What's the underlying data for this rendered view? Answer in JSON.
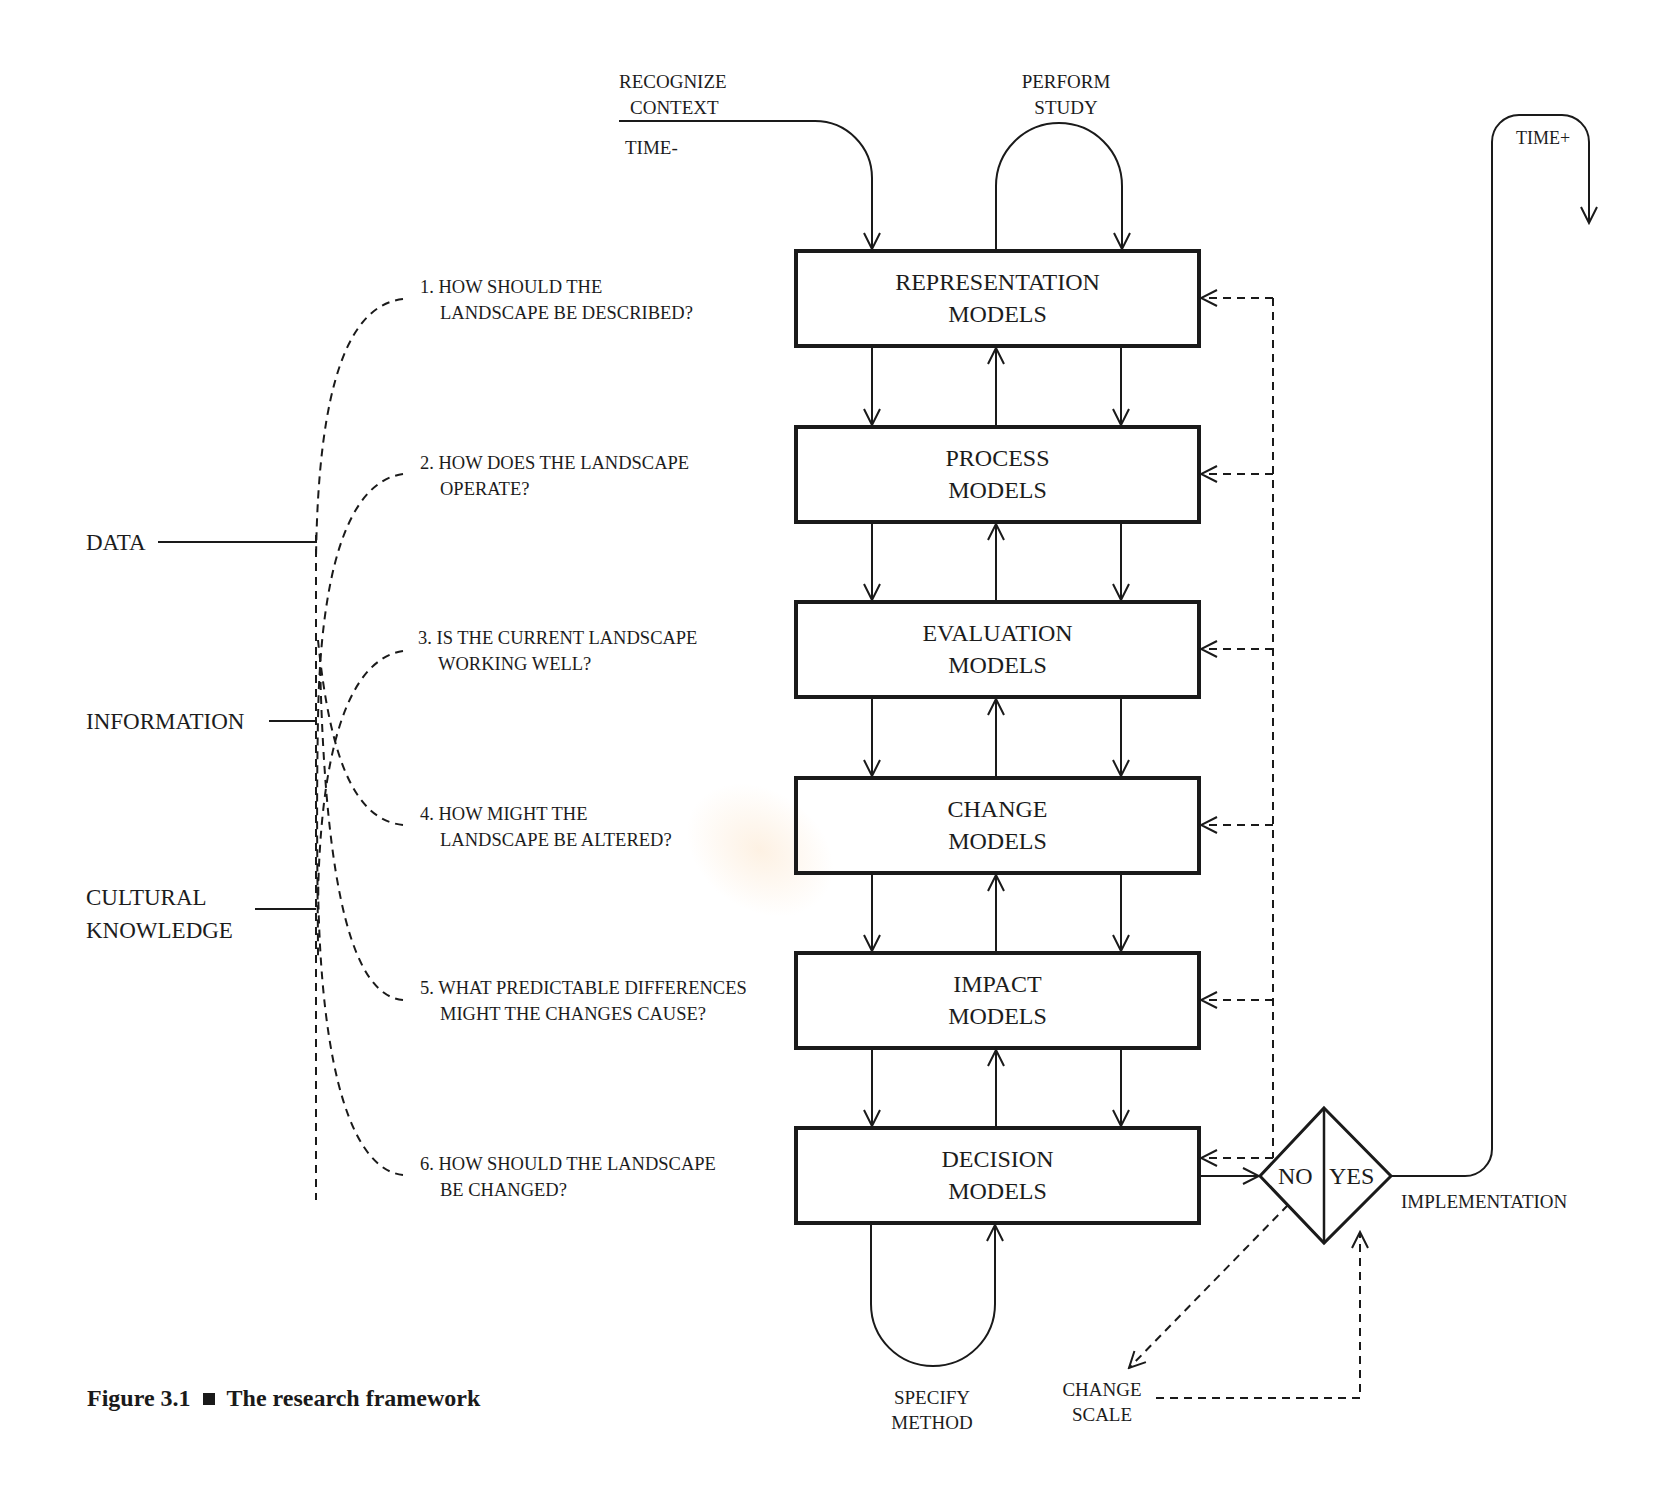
{
  "figure": {
    "caption_number": "Figure 3.1",
    "caption_separator": "■",
    "caption_title": "The research framework"
  },
  "top_labels": {
    "recognize_line1": "RECOGNIZE",
    "recognize_line2": "CONTEXT",
    "time_minus": "TIME-",
    "perform_line1": "PERFORM",
    "perform_line2": "STUDY",
    "time_plus": "TIME+"
  },
  "models": [
    {
      "line1": "REPRESENTATION",
      "line2": "MODELS"
    },
    {
      "line1": "PROCESS",
      "line2": "MODELS"
    },
    {
      "line1": "EVALUATION",
      "line2": "MODELS"
    },
    {
      "line1": "CHANGE",
      "line2": "MODELS"
    },
    {
      "line1": "IMPACT",
      "line2": "MODELS"
    },
    {
      "line1": "DECISION",
      "line2": "MODELS"
    }
  ],
  "questions": [
    {
      "line1": "1. HOW SHOULD THE",
      "line2": "LANDSCAPE BE DESCRIBED?"
    },
    {
      "line1": "2. HOW DOES THE LANDSCAPE",
      "line2": "OPERATE?"
    },
    {
      "line1": "3. IS THE CURRENT LANDSCAPE",
      "line2": "WORKING WELL?"
    },
    {
      "line1": "4. HOW MIGHT THE",
      "line2": "LANDSCAPE BE ALTERED?"
    },
    {
      "line1": "5. WHAT PREDICTABLE DIFFERENCES",
      "line2": "MIGHT THE CHANGES CAUSE?"
    },
    {
      "line1": "6. HOW SHOULD THE LANDSCAPE",
      "line2": "BE CHANGED?"
    }
  ],
  "knowledge_levels": {
    "data": "DATA",
    "information": "INFORMATION",
    "cultural_line1": "CULTURAL",
    "cultural_line2": "KNOWLEDGE"
  },
  "decision": {
    "no": "NO",
    "yes": "YES",
    "implementation": "IMPLEMENTATION"
  },
  "bottom_labels": {
    "specify_line1": "SPECIFY",
    "specify_line2": "METHOD",
    "change_scale_line1": "CHANGE",
    "change_scale_line2": "SCALE"
  },
  "colors": {
    "ink": "#1a1a1a",
    "background": "#ffffff"
  }
}
